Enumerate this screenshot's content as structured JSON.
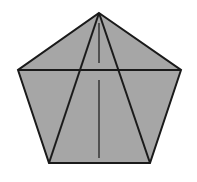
{
  "diagram": {
    "width": 197,
    "height": 182,
    "shape": "pentagon",
    "fill_color": "#a6a6a6",
    "stroke_color": "#1a1a1a",
    "background": "#ffffff",
    "vertices": {
      "top": [
        99,
        13
      ],
      "left": [
        18,
        70
      ],
      "right": [
        181,
        70
      ],
      "bottom_left": [
        49,
        163
      ],
      "bottom_right": [
        150,
        163
      ]
    },
    "lines": [
      {
        "name": "horizontal-diagonal",
        "from": "left",
        "to": "right"
      },
      {
        "name": "diagonal-top-to-bottom-left",
        "from": "top",
        "to": "bottom_left"
      },
      {
        "name": "diagonal-top-to-bottom-right",
        "from": "top",
        "to": "bottom_right"
      }
    ],
    "altitude_segments": [
      {
        "x": 99,
        "y1": 23,
        "y2": 63
      },
      {
        "x": 99,
        "y1": 80,
        "y2": 158
      }
    ]
  }
}
